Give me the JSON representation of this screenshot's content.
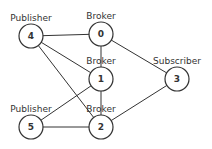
{
  "nodes": [
    {
      "id": "0",
      "role": "Broker",
      "x": 101,
      "y": 34
    },
    {
      "id": "1",
      "role": "Broker",
      "x": 101,
      "y": 79
    },
    {
      "id": "2",
      "role": "Broker",
      "x": 101,
      "y": 127
    },
    {
      "id": "3",
      "role": "Subscriber",
      "x": 177,
      "y": 79
    },
    {
      "id": "4",
      "role": "Publisher",
      "x": 31,
      "y": 36
    },
    {
      "id": "5",
      "role": "Publisher",
      "x": 31,
      "y": 127
    }
  ],
  "edges": [
    [
      "4",
      "0"
    ],
    [
      "4",
      "1"
    ],
    [
      "4",
      "2"
    ],
    [
      "5",
      "1"
    ],
    [
      "5",
      "2"
    ],
    [
      "0",
      "1"
    ],
    [
      "1",
      "2"
    ],
    [
      "0",
      "3"
    ],
    [
      "2",
      "3"
    ]
  ],
  "colors": {
    "stroke": "#333333",
    "background": "#ffffff"
  }
}
